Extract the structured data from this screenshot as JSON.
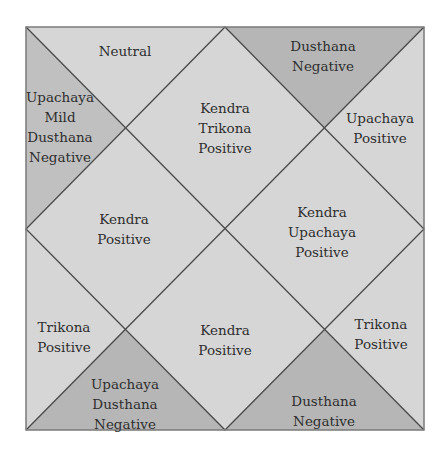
{
  "diagram": {
    "type": "north-indian-house-chart",
    "colors": {
      "background": "#ffffff",
      "light_fill": "#d6d6d6",
      "medium_fill": "#c2c2c2",
      "dark_fill": "#b6b6b6",
      "line": "#4a4a4a",
      "border": "#7a7a7a",
      "text": "#2e2e2e"
    },
    "houses": [
      {
        "id": "top-left",
        "lines": [
          "Neutral"
        ]
      },
      {
        "id": "top-right",
        "lines": [
          "Dusthana",
          "Negative"
        ]
      },
      {
        "id": "left-upper",
        "lines": [
          "Upachaya",
          "Mild",
          "Dusthana",
          "Negative"
        ]
      },
      {
        "id": "center-top",
        "lines": [
          "Kendra",
          "Trikona",
          "Positive"
        ]
      },
      {
        "id": "right-upper",
        "lines": [
          "Upachaya",
          "Positive"
        ]
      },
      {
        "id": "center-left",
        "lines": [
          "Kendra",
          "Positive"
        ]
      },
      {
        "id": "center-right",
        "lines": [
          "Kendra",
          "Upachaya",
          "Positive"
        ]
      },
      {
        "id": "left-lower",
        "lines": [
          "Trikona",
          "Positive"
        ]
      },
      {
        "id": "center-bottom",
        "lines": [
          "Kendra",
          "Positive"
        ]
      },
      {
        "id": "right-lower",
        "lines": [
          "Trikona",
          "Positive"
        ]
      },
      {
        "id": "bottom-left",
        "lines": [
          "Upachaya",
          "Dusthana",
          "Negative"
        ]
      },
      {
        "id": "bottom-right",
        "lines": [
          "Dusthana",
          "Negative"
        ]
      }
    ]
  }
}
